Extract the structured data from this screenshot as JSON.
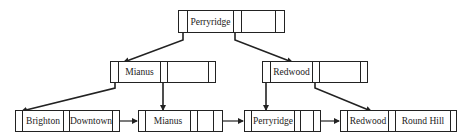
{
  "diagram": {
    "nodes": [
      {
        "id": "root",
        "level": "root",
        "keys": [
          "Perryridge",
          ""
        ],
        "x": 178,
        "y": 10,
        "w": 107,
        "h": 23
      },
      {
        "id": "int-left",
        "level": "internal",
        "keys": [
          "Mianus",
          ""
        ],
        "x": 110,
        "y": 61,
        "w": 106,
        "h": 22
      },
      {
        "id": "int-right",
        "level": "internal",
        "keys": [
          "Redwood",
          ""
        ],
        "x": 262,
        "y": 61,
        "w": 106,
        "h": 22
      },
      {
        "id": "leaf-1",
        "level": "leaf",
        "keys": [
          "Brighton",
          "Downtown"
        ],
        "x": 15,
        "y": 110,
        "w": 105,
        "h": 22
      },
      {
        "id": "leaf-2",
        "level": "leaf",
        "keys": [
          "Mianus",
          ""
        ],
        "x": 138,
        "y": 110,
        "w": 85,
        "h": 22
      },
      {
        "id": "leaf-3",
        "level": "leaf",
        "keys": [
          "Perryridge",
          ""
        ],
        "x": 244,
        "y": 110,
        "w": 77,
        "h": 22
      },
      {
        "id": "leaf-4",
        "level": "leaf",
        "keys": [
          "Redwood",
          "Round Hill"
        ],
        "x": 340,
        "y": 110,
        "w": 117,
        "h": 22
      }
    ],
    "labels": {
      "root_key": "Perryridge",
      "int_left_key": "Mianus",
      "int_right_key": "Redwood",
      "leaf1_key1": "Brighton",
      "leaf1_key2": "Downtown",
      "leaf2_key1": "Mianus",
      "leaf3_key1": "Perryridge",
      "leaf4_key1": "Redwood",
      "leaf4_key2": "Round Hill"
    },
    "edges": [
      {
        "from": "root",
        "to": "int-left",
        "type": "child-pointer"
      },
      {
        "from": "root",
        "to": "int-right",
        "type": "child-pointer"
      },
      {
        "from": "int-left",
        "to": "leaf-1",
        "type": "child-pointer"
      },
      {
        "from": "int-left",
        "to": "leaf-2",
        "type": "child-pointer"
      },
      {
        "from": "int-right",
        "to": "leaf-3",
        "type": "child-pointer"
      },
      {
        "from": "int-right",
        "to": "leaf-4",
        "type": "child-pointer"
      },
      {
        "from": "leaf-1",
        "to": "leaf-2",
        "type": "sibling-pointer"
      },
      {
        "from": "leaf-2",
        "to": "leaf-3",
        "type": "sibling-pointer"
      },
      {
        "from": "leaf-3",
        "to": "leaf-4",
        "type": "sibling-pointer"
      }
    ],
    "colors": {
      "line": "#222222",
      "background": "#ffffff",
      "text": "#222222"
    }
  }
}
